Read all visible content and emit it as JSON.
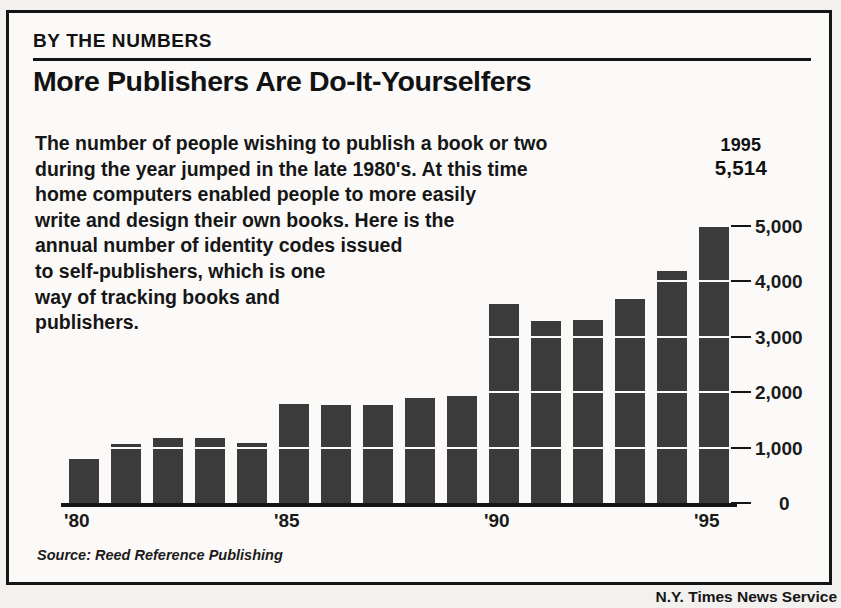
{
  "header": {
    "kicker": "BY THE NUMBERS",
    "headline": "More Publishers Are Do-It-Yourselfers"
  },
  "body_lines": [
    "The number of people wishing to publish a book or two",
    "during the year jumped in the late 1980's. At this time",
    "home computers enabled people to more easily",
    "write and design their own books. Here is the",
    "annual number of identity codes issued",
    "to self-publishers, which is one",
    "way of tracking books and",
    "publishers."
  ],
  "callout": {
    "year": "1995",
    "value": "5,514"
  },
  "source": "Source: Reed Reference Publishing",
  "credit": "N.Y. Times News Service",
  "colors": {
    "bar": "#3b3b3b",
    "ink": "#151515",
    "paper": "#fbfaf8",
    "page": "#f2f1ef"
  },
  "chart_data": {
    "type": "bar",
    "title": "More Publishers Are Do-It-Yourselfers",
    "subtitle": "BY THE NUMBERS",
    "xlabel": "",
    "ylabel": "",
    "categories": [
      "1980",
      "1981",
      "1982",
      "1983",
      "1984",
      "1985",
      "1986",
      "1987",
      "1988",
      "1989",
      "1990",
      "1991",
      "1992",
      "1993",
      "1994",
      "1995"
    ],
    "tick_labels_x": [
      "'80",
      "'85",
      "'90",
      "'95"
    ],
    "tick_positions_x": [
      0,
      5,
      10,
      15
    ],
    "values": [
      800,
      1060,
      1180,
      1180,
      1090,
      1790,
      1770,
      1770,
      1900,
      1930,
      3590,
      3290,
      3300,
      3680,
      4190,
      4980
    ],
    "annotated_point": {
      "category": "1995",
      "label_year": "1995",
      "label_value": "5,514",
      "value": 5514
    },
    "ylim": [
      0,
      5600
    ],
    "yticks": [
      0,
      1000,
      2000,
      3000,
      4000,
      5000
    ],
    "ytick_labels": [
      "0",
      "1,000",
      "2,000",
      "3,000",
      "4,000",
      "5,000"
    ],
    "grid": true,
    "grid_axis": "y",
    "legend": false,
    "bar_color": "#3b3b3b",
    "source": "Source: Reed Reference Publishing"
  }
}
